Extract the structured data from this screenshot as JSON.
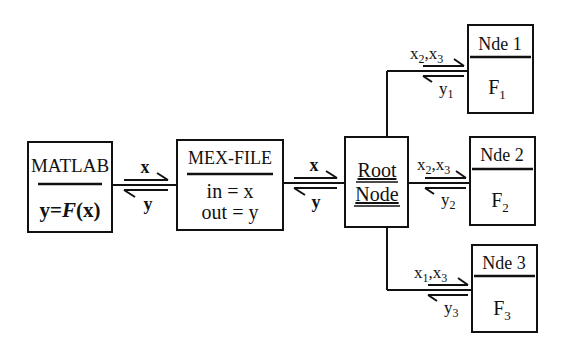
{
  "diagram": {
    "matlab": {
      "title": "MATLAB",
      "formula_y": "y",
      "formula_eq": "=",
      "formula_F": "F",
      "formula_x": "(x)"
    },
    "mex": {
      "title": "MEX-FILE",
      "line1": "in = x",
      "line2": "out = y"
    },
    "root": {
      "line1": "Root",
      "line2": "Node"
    },
    "link_matlab_mex": {
      "forward": "x",
      "back": "y"
    },
    "link_mex_root": {
      "forward": "x",
      "back": "y"
    },
    "nodes": [
      {
        "title": "Nde 1",
        "func": "F",
        "func_sub": "1",
        "in_a": "x",
        "in_a_sub": "2",
        "in_b": "x",
        "in_b_sub": "3",
        "out": "y",
        "out_sub": "1"
      },
      {
        "title": "Nde 2",
        "func": "F",
        "func_sub": "2",
        "in_a": "x",
        "in_a_sub": "2",
        "in_b": "x",
        "in_b_sub": "3",
        "out": "y",
        "out_sub": "2"
      },
      {
        "title": "Nde 3",
        "func": "F",
        "func_sub": "3",
        "in_a": "x",
        "in_a_sub": "1",
        "in_b": "x",
        "in_b_sub": "3",
        "out": "y",
        "out_sub": "3"
      }
    ],
    "colors": {
      "ink": "#111111",
      "background": "#ffffff"
    }
  }
}
